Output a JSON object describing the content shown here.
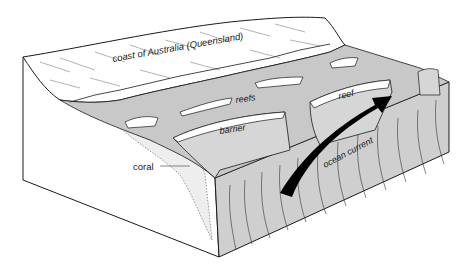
{
  "diagram": {
    "labels": {
      "coast": "coast of Australia (Queensland)",
      "reefs": "reefs",
      "reef": "reef",
      "barrier": "barrier",
      "coral": "coral",
      "ocean_current": "ocean current"
    },
    "colors": {
      "sea_floor": "#c8c8c8",
      "land": "#ffffff",
      "outline": "#1a1a1a",
      "arrow": "#000000",
      "reef_top": "#ffffff"
    }
  }
}
